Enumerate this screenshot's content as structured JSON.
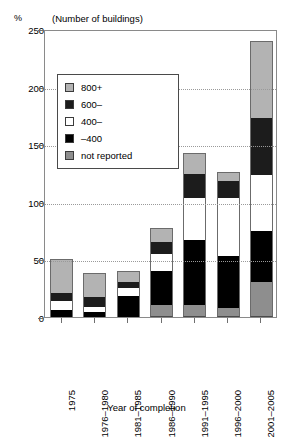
{
  "header": {
    "percent_symbol": "%",
    "units_note": "(Number of buildings)"
  },
  "axis": {
    "x_title": "Year of completion",
    "y_ticks": [
      "250",
      "200",
      "150",
      "100",
      "50",
      "0"
    ],
    "x_ticks": [
      "1975",
      "1976–1980",
      "1981–1985",
      "1986–1990",
      "1991–1995",
      "1996–2000",
      "2001–2005"
    ]
  },
  "legend": {
    "items": [
      {
        "label": "800+",
        "key": "s800",
        "color": "#b3b3b3"
      },
      {
        "label": "600–",
        "key": "s600",
        "color": "#1c1c1c"
      },
      {
        "label": "400–",
        "key": "s400",
        "color": "#ffffff"
      },
      {
        "label": "–400",
        "key": "sm400",
        "color": "#000000"
      },
      {
        "label": "not reported",
        "key": "snr",
        "color": "#8e8e8e"
      }
    ]
  },
  "chart_data": {
    "type": "bar",
    "stacked": true,
    "title": "",
    "subtitle": "(Number of buildings)",
    "xlabel": "Year of completion",
    "ylabel": "%",
    "ylim": [
      0,
      250
    ],
    "yticks": [
      0,
      50,
      100,
      150,
      200,
      250
    ],
    "grid": true,
    "legend_position": "inside-upper-left",
    "categories": [
      "1975",
      "1976–1980",
      "1981–1985",
      "1986–1990",
      "1991–1995",
      "1996–2000",
      "2001–2005"
    ],
    "series": [
      {
        "name": "not reported",
        "color": "#8e8e8e",
        "values": [
          0,
          0,
          0,
          10,
          10,
          8,
          30
        ]
      },
      {
        "name": "–400",
        "color": "#000000",
        "values": [
          6,
          4,
          18,
          30,
          57,
          45,
          45
        ]
      },
      {
        "name": "400–",
        "color": "#ffffff",
        "values": [
          8,
          5,
          7,
          15,
          36,
          50,
          48
        ]
      },
      {
        "name": "600–",
        "color": "#1c1c1c",
        "values": [
          7,
          8,
          5,
          10,
          21,
          15,
          50
        ]
      },
      {
        "name": "800+",
        "color": "#b3b3b3",
        "values": [
          29,
          21,
          10,
          12,
          18,
          8,
          67
        ]
      }
    ],
    "totals": [
      50,
      38,
      40,
      77,
      142,
      126,
      240
    ]
  }
}
